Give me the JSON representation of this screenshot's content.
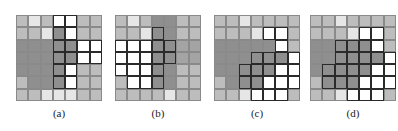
{
  "figure": {
    "legend": {
      "L": "light gray cell",
      "P": "pale (near-white) cell",
      "W": "white cell",
      "D": "dark gray cell",
      "M": "medium gray cell",
      "o_suffix": "cell outlined with thick black border"
    },
    "panels": [
      {
        "label": "(a)",
        "left": 16,
        "rows": [
          [
            "L",
            "P",
            "L",
            "Wo",
            "Wo",
            "L",
            "L"
          ],
          [
            "L",
            "L",
            "P",
            "Do",
            "Wo",
            "L",
            "L"
          ],
          [
            "D",
            "D",
            "D",
            "Do",
            "Do",
            "Wo",
            "Wo"
          ],
          [
            "D",
            "D",
            "D",
            "Do",
            "Do",
            "Wo",
            "Wo"
          ],
          [
            "D",
            "D",
            "D",
            "Do",
            "Wo",
            "L",
            "L"
          ],
          [
            "L",
            "D",
            "D",
            "Do",
            "Wo",
            "L",
            "L"
          ],
          [
            "L",
            "L",
            "P",
            "P",
            "P",
            "L",
            "L"
          ]
        ]
      },
      {
        "label": "(b)",
        "left": 115,
        "rows": [
          [
            "L",
            "P",
            "L",
            "D",
            "D",
            "L",
            "L"
          ],
          [
            "L",
            "L",
            "P",
            "Do",
            "D",
            "L",
            "L"
          ],
          [
            "Wo",
            "Wo",
            "Wo",
            "Do",
            "Do",
            "M",
            "M"
          ],
          [
            "Wo",
            "Wo",
            "Wo",
            "Do",
            "Do",
            "M",
            "M"
          ],
          [
            "Wo",
            "Wo",
            "Wo",
            "Do",
            "D",
            "L",
            "L"
          ],
          [
            "L",
            "Wo",
            "Wo",
            "Do",
            "D",
            "L",
            "L"
          ],
          [
            "L",
            "L",
            "L",
            "L",
            "P",
            "L",
            "L"
          ]
        ]
      },
      {
        "label": "(c)",
        "left": 214,
        "rows": [
          [
            "L",
            "L",
            "P",
            "L",
            "L",
            "L",
            "L"
          ],
          [
            "L",
            "L",
            "L",
            "P",
            "Wo",
            "Wo",
            "L"
          ],
          [
            "D",
            "D",
            "D",
            "D",
            "D",
            "Wo",
            "L"
          ],
          [
            "D",
            "D",
            "D",
            "Do",
            "Do",
            "Do",
            "Wo"
          ],
          [
            "D",
            "D",
            "Do",
            "Do",
            "Do",
            "Wo",
            "Wo"
          ],
          [
            "L",
            "D",
            "Do",
            "Do",
            "Wo",
            "Wo",
            "Wo"
          ],
          [
            "L",
            "L",
            "P",
            "Wo",
            "Wo",
            "Wo",
            "L"
          ]
        ]
      },
      {
        "label": "(d)",
        "left": 310,
        "rows": [
          [
            "L",
            "L",
            "P",
            "L",
            "L",
            "L",
            "L"
          ],
          [
            "L",
            "L",
            "L",
            "P",
            "Wo",
            "Wo",
            "L"
          ],
          [
            "D",
            "D",
            "Do",
            "Do",
            "Do",
            "Wo",
            "L"
          ],
          [
            "D",
            "D",
            "Do",
            "Do",
            "Do",
            "Do",
            "Wo"
          ],
          [
            "D",
            "Do",
            "Do",
            "Do",
            "Do",
            "Wo",
            "Wo"
          ],
          [
            "L",
            "Do",
            "Do",
            "Do",
            "Wo",
            "Wo",
            "Wo"
          ],
          [
            "L",
            "L",
            "P",
            "Wo",
            "Wo",
            "Wo",
            "L"
          ]
        ]
      }
    ]
  }
}
